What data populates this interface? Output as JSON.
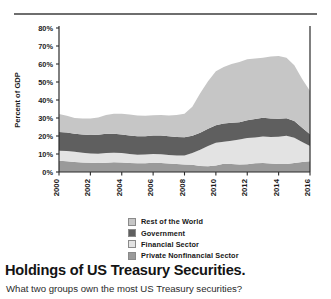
{
  "divider": {
    "name": "top-rule",
    "color": "#6e6e6e"
  },
  "caption": {
    "title": "Holdings of US Treasury Securities.",
    "subtitle": "What two groups own the most US Treasury securities?"
  },
  "legend": {
    "position": "below-chart",
    "items": [
      {
        "label": "Rest of the World",
        "color": "#c6c6c6"
      },
      {
        "label": "Government",
        "color": "#5f5f5f"
      },
      {
        "label": "Financial Sector",
        "color": "#e3e3e3"
      },
      {
        "label": "Private Nonfinancial Sector",
        "color": "#9a9a9a"
      }
    ]
  },
  "chart_data": {
    "type": "area",
    "stacked": true,
    "title": "",
    "xlabel": "",
    "ylabel": "Percent of GDP",
    "ylim": [
      0,
      80
    ],
    "yticks": [
      0,
      10,
      20,
      30,
      40,
      50,
      60,
      70,
      80
    ],
    "ytick_labels": [
      "0%",
      "10%",
      "20%",
      "30%",
      "40%",
      "50%",
      "60%",
      "70%",
      "80%"
    ],
    "xlim": [
      2000,
      2016
    ],
    "xticks": [
      2000,
      2002,
      2004,
      2006,
      2008,
      2010,
      2012,
      2014,
      2016
    ],
    "xtick_labels": [
      "2000",
      "2002",
      "2004",
      "2006",
      "2008",
      "2010",
      "2012",
      "2014",
      "2016"
    ],
    "xtick_rotation": 90,
    "grid": false,
    "x": [
      2000,
      2000.5,
      2001,
      2001.5,
      2002,
      2002.5,
      2003,
      2003.5,
      2004,
      2004.5,
      2005,
      2005.5,
      2006,
      2006.5,
      2007,
      2007.5,
      2008,
      2008.5,
      2009,
      2009.5,
      2010,
      2010.5,
      2011,
      2011.5,
      2012,
      2012.5,
      2013,
      2013.5,
      2014,
      2014.5,
      2015,
      2015.5,
      2016
    ],
    "stack_order_bottom_to_top": [
      "Private Nonfinancial Sector",
      "Financial Sector",
      "Government",
      "Rest of the World"
    ],
    "series": [
      {
        "name": "Private Nonfinancial Sector",
        "color": "#9a9a9a",
        "values": [
          6.2,
          6.0,
          5.6,
          5.3,
          5.1,
          5.0,
          5.2,
          5.4,
          5.3,
          5.0,
          4.8,
          4.9,
          5.1,
          5.0,
          4.7,
          4.4,
          4.2,
          4.0,
          3.4,
          3.2,
          3.6,
          4.6,
          4.4,
          4.1,
          4.3,
          4.8,
          5.0,
          4.7,
          4.4,
          4.5,
          5.0,
          5.6,
          6.0
        ]
      },
      {
        "name": "Financial Sector",
        "color": "#e3e3e3",
        "values": [
          5.6,
          5.7,
          5.6,
          5.4,
          5.2,
          5.2,
          5.3,
          5.3,
          5.2,
          5.0,
          4.8,
          4.8,
          4.9,
          4.9,
          4.8,
          4.8,
          5.0,
          6.6,
          9.0,
          11.2,
          12.6,
          12.2,
          13.0,
          14.0,
          14.6,
          14.4,
          14.7,
          14.8,
          15.2,
          15.6,
          14.0,
          11.0,
          8.4
        ]
      },
      {
        "name": "Government",
        "color": "#5f5f5f",
        "values": [
          10.4,
          10.2,
          10.0,
          10.2,
          10.3,
          10.5,
          10.7,
          10.6,
          10.4,
          10.3,
          10.2,
          10.2,
          10.3,
          10.4,
          10.3,
          10.2,
          10.1,
          9.6,
          9.4,
          9.6,
          9.8,
          10.2,
          10.0,
          9.6,
          9.8,
          10.2,
          10.4,
          10.2,
          10.0,
          9.8,
          9.3,
          8.0,
          6.6
        ]
      },
      {
        "name": "Rest of the World",
        "color": "#c6c6c6",
        "values": [
          10.0,
          9.4,
          8.8,
          8.8,
          9.1,
          9.6,
          10.4,
          11.0,
          11.4,
          11.6,
          11.6,
          11.4,
          11.2,
          11.4,
          11.6,
          12.2,
          13.0,
          16.0,
          22.0,
          26.4,
          30.0,
          31.4,
          32.6,
          33.4,
          34.0,
          33.6,
          33.4,
          34.4,
          34.8,
          33.6,
          31.0,
          27.0,
          24.0
        ]
      }
    ]
  }
}
